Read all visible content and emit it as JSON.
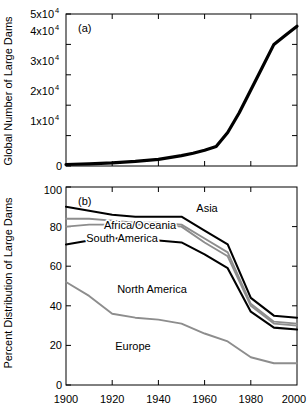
{
  "figure": {
    "panels": [
      {
        "tag": "(a)",
        "ylabel": "Global Number of Large Dams",
        "xlabel": ""
      },
      {
        "tag": "(b)",
        "ylabel": "Percent Distribution of Large Dams",
        "xlabel": ""
      }
    ]
  },
  "colors": {
    "black": "#000000",
    "gray": "#8d8d8d",
    "background": "#ffffff"
  },
  "axis_a": {
    "ytick_labels": [
      "0",
      "1x10",
      "2x10",
      "3x10",
      "4x10",
      "5x10"
    ],
    "ytick_exponents": [
      "",
      "4",
      "4",
      "4",
      "4",
      "4"
    ],
    "ytick_values": [
      0,
      10000,
      20000,
      30000,
      40000,
      50000
    ],
    "xtick_values": [
      1900,
      1920,
      1940,
      1960,
      1980,
      2000
    ]
  },
  "axis_b": {
    "ytick_labels": [
      "0",
      "20",
      "40",
      "60",
      "80",
      "100"
    ],
    "ytick_values": [
      0,
      20,
      40,
      60,
      80,
      100
    ],
    "xtick_labels": [
      "1900",
      "1920",
      "1940",
      "1960",
      "1980",
      "2000"
    ],
    "xtick_values": [
      1900,
      1920,
      1940,
      1960,
      1980,
      2000
    ]
  },
  "region_labels": {
    "asia": "Asia",
    "africa_oceania": "Africa/Oceania",
    "south_america": "South America",
    "north_america": "North America",
    "europe": "Europe"
  },
  "chart_data": [
    {
      "type": "line",
      "panel": "(a)",
      "title": "",
      "xlabel": "",
      "ylabel": "Global Number of Large Dams",
      "xlim": [
        1900,
        2000
      ],
      "ylim": [
        0,
        50000
      ],
      "grid": false,
      "legend": "none",
      "x": [
        1900,
        1910,
        1920,
        1930,
        1940,
        1950,
        1955,
        1960,
        1965,
        1970,
        1975,
        1980,
        1985,
        1990,
        1995,
        2000
      ],
      "series": [
        {
          "name": "Global number of large dams",
          "color": "#000000",
          "values": [
            500,
            700,
            1000,
            1500,
            2200,
            3400,
            4200,
            5200,
            6400,
            11000,
            17500,
            25000,
            32500,
            40000,
            43000,
            46000
          ]
        }
      ]
    },
    {
      "type": "line",
      "panel": "(b)",
      "title": "",
      "xlabel": "",
      "ylabel": "Percent Distribution of Large Dams",
      "xlim": [
        1900,
        2000
      ],
      "ylim": [
        0,
        100
      ],
      "grid": false,
      "legend": "inline-labels",
      "note": "Cumulative stacked boundary curves. Asia occupies the band above the top curve; Africa/Oceania between curve 4 and 3; South America between curve 3 and 2; North America between curve 2 and Europe; Europe below the bottom curve.",
      "x": [
        1900,
        1910,
        1920,
        1930,
        1940,
        1950,
        1960,
        1970,
        1980,
        1990,
        2000
      ],
      "series": [
        {
          "name": "Europe (upper boundary)",
          "color": "#8d8d8d",
          "values": [
            52,
            45,
            36,
            34,
            33,
            31,
            26,
            22,
            14,
            11,
            11
          ]
        },
        {
          "name": "Europe + North America (upper boundary)",
          "color": "#000000",
          "values": [
            71,
            73,
            74,
            74,
            73,
            72,
            66,
            59,
            37,
            29,
            28
          ]
        },
        {
          "name": "+ South America (upper boundary)",
          "color": "#8d8d8d",
          "values": [
            80,
            81,
            81,
            81,
            81,
            80,
            72,
            65,
            40,
            31,
            30
          ]
        },
        {
          "name": "+ Africa/Oceania (upper boundary)",
          "color": "#bdbdbd",
          "values": [
            84,
            84,
            83,
            82,
            82,
            81,
            74,
            67,
            41,
            32,
            31
          ]
        },
        {
          "name": "+ Asia = 100 (top boundary)",
          "color": "#000000",
          "values": [
            90,
            88,
            86,
            85,
            85,
            85,
            78,
            71,
            44,
            35,
            34
          ]
        }
      ]
    }
  ]
}
